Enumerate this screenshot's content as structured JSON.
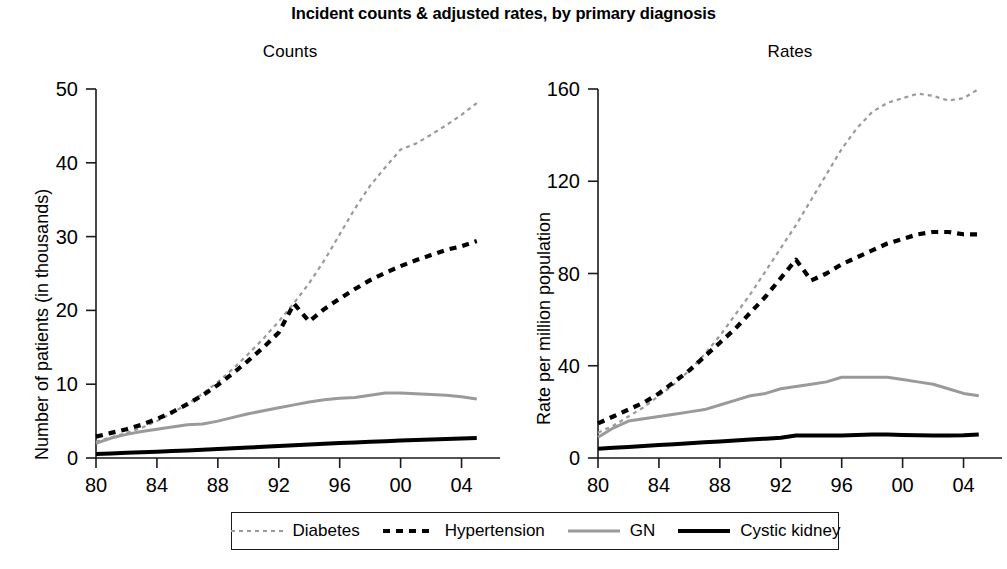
{
  "figure": {
    "title": "Incident counts & adjusted rates, by primary diagnosis"
  },
  "panels": {
    "counts": {
      "title": "Counts",
      "ylabel": "Number of patients (in thousands)"
    },
    "rates": {
      "title": "Rates",
      "ylabel": "Rate per million population"
    }
  },
  "legend": {
    "items": [
      {
        "label": "Diabetes",
        "color": "#9a9a9a",
        "width": 2.2,
        "dash": "4,4",
        "style": "dotted-line"
      },
      {
        "label": "Hypertension",
        "color": "#000000",
        "width": 4.2,
        "dash": "7,6",
        "style": "dashed-line"
      },
      {
        "label": "GN",
        "color": "#9a9a9a",
        "width": 3.0,
        "dash": "none",
        "style": "solid-line"
      },
      {
        "label": "Cystic kidney",
        "color": "#000000",
        "width": 4.0,
        "dash": "none",
        "style": "solid-line"
      }
    ]
  },
  "chart_data": [
    {
      "type": "line",
      "id": "counts",
      "title": "Counts",
      "xlabel": "",
      "ylabel": "Number of patients (in thousands)",
      "xlim": [
        1980,
        2006
      ],
      "ylim": [
        0,
        50
      ],
      "yticks": [
        0,
        10,
        20,
        30,
        40,
        50
      ],
      "ytick_labels": [
        "0",
        "10",
        "20",
        "30",
        "40",
        "50"
      ],
      "xticks": [
        1980,
        1984,
        1988,
        1992,
        1996,
        2000,
        2004
      ],
      "xtick_labels": [
        "80",
        "84",
        "88",
        "92",
        "96",
        "00",
        "04"
      ],
      "grid": false,
      "legend_position": "bottom",
      "x": [
        1980,
        1981,
        1982,
        1983,
        1984,
        1985,
        1986,
        1987,
        1988,
        1989,
        1990,
        1991,
        1992,
        1993,
        1994,
        1995,
        1996,
        1997,
        1998,
        1999,
        2000,
        2001,
        2002,
        2003,
        2004,
        2005
      ],
      "series": [
        {
          "name": "Diabetes",
          "color": "#9a9a9a",
          "dash": "4,4",
          "width": 2.2,
          "values": [
            2.2,
            2.8,
            3.4,
            4.1,
            5.0,
            6.1,
            7.3,
            8.7,
            10.3,
            12.1,
            14.1,
            16.2,
            18.5,
            21.0,
            23.7,
            26.8,
            30.3,
            33.8,
            36.9,
            39.4,
            41.8,
            42.6,
            43.8,
            45.1,
            46.5,
            48.1
          ]
        },
        {
          "name": "Hypertension",
          "color": "#000000",
          "dash": "7,6",
          "width": 4.2,
          "values": [
            2.9,
            3.4,
            3.9,
            4.5,
            5.3,
            6.2,
            7.3,
            8.5,
            9.9,
            11.5,
            13.2,
            15.0,
            17.0,
            20.9,
            18.5,
            20.2,
            21.6,
            22.9,
            24.1,
            25.1,
            26.0,
            26.8,
            27.5,
            28.2,
            28.7,
            29.4
          ]
        },
        {
          "name": "GN",
          "color": "#9a9a9a",
          "dash": "none",
          "width": 3.0,
          "values": [
            2.0,
            2.7,
            3.2,
            3.6,
            3.9,
            4.2,
            4.5,
            4.6,
            5.0,
            5.5,
            6.0,
            6.4,
            6.8,
            7.2,
            7.6,
            7.9,
            8.1,
            8.2,
            8.5,
            8.8,
            8.8,
            8.7,
            8.6,
            8.5,
            8.3,
            8.0
          ]
        },
        {
          "name": "Cystic kidney",
          "color": "#000000",
          "dash": "none",
          "width": 4.0,
          "values": [
            0.55,
            0.62,
            0.7,
            0.78,
            0.86,
            0.95,
            1.03,
            1.12,
            1.22,
            1.32,
            1.42,
            1.52,
            1.62,
            1.72,
            1.82,
            1.92,
            2.02,
            2.11,
            2.2,
            2.28,
            2.36,
            2.44,
            2.52,
            2.58,
            2.64,
            2.72
          ]
        }
      ]
    },
    {
      "type": "line",
      "id": "rates",
      "title": "Rates",
      "xlabel": "",
      "ylabel": "Rate per million population",
      "xlim": [
        1980,
        2006
      ],
      "ylim": [
        0,
        160
      ],
      "yticks": [
        0,
        40,
        80,
        120,
        160
      ],
      "ytick_labels": [
        "0",
        "40",
        "80",
        "120",
        "160"
      ],
      "xticks": [
        1980,
        1984,
        1988,
        1992,
        1996,
        2000,
        2004
      ],
      "xtick_labels": [
        "80",
        "84",
        "88",
        "92",
        "96",
        "00",
        "04"
      ],
      "grid": false,
      "legend_position": "bottom",
      "x": [
        1980,
        1981,
        1982,
        1983,
        1984,
        1985,
        1986,
        1987,
        1988,
        1989,
        1990,
        1991,
        1992,
        1993,
        1994,
        1995,
        1996,
        1997,
        1998,
        1999,
        2000,
        2001,
        2002,
        2003,
        2004,
        2005
      ],
      "series": [
        {
          "name": "Diabetes",
          "color": "#9a9a9a",
          "dash": "4,4",
          "width": 2.2,
          "values": [
            11,
            14,
            18,
            22,
            27,
            32,
            38,
            45,
            53,
            62,
            71,
            81,
            91,
            101,
            112,
            123,
            134,
            143,
            150,
            154,
            156,
            158,
            157,
            155,
            156,
            160
          ]
        },
        {
          "name": "Hypertension",
          "color": "#000000",
          "dash": "7,6",
          "width": 4.2,
          "values": [
            15,
            18,
            21,
            24,
            28,
            33,
            38,
            44,
            50,
            56,
            63,
            70,
            78,
            86,
            77,
            80,
            84,
            87,
            90,
            93,
            95,
            97,
            98,
            98,
            97,
            97
          ]
        },
        {
          "name": "GN",
          "color": "#9a9a9a",
          "dash": "none",
          "width": 3.0,
          "values": [
            9,
            13,
            16,
            17,
            18,
            19,
            20,
            21,
            23,
            25,
            27,
            28,
            30,
            31,
            32,
            33,
            35,
            35,
            35,
            35,
            34,
            33,
            32,
            30,
            28,
            27
          ]
        },
        {
          "name": "Cystic kidney",
          "color": "#000000",
          "dash": "none",
          "width": 4.0,
          "values": [
            4.0,
            4.4,
            4.8,
            5.2,
            5.6,
            6.0,
            6.4,
            6.8,
            7.2,
            7.6,
            8.0,
            8.4,
            8.8,
            9.8,
            9.8,
            9.8,
            9.8,
            10.0,
            10.2,
            10.2,
            10.0,
            9.9,
            9.8,
            9.8,
            9.9,
            10.2
          ]
        }
      ]
    }
  ]
}
